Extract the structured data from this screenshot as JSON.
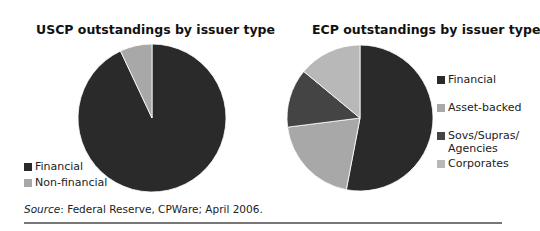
{
  "chart_data": [
    {
      "type": "pie",
      "title": "USCP outstandings by issuer type",
      "categories": [
        "Financial",
        "Non-financial"
      ],
      "values": [
        93,
        7
      ],
      "unit": "% (estimated from slice angles)",
      "colors": [
        "#2a2a2a",
        "#a8a8a8"
      ],
      "start_angle_deg": 0,
      "direction": "counterclockwise-for-second-slice",
      "legend_position": "bottom-left",
      "legend": [
        "Financial",
        "Non-financial"
      ]
    },
    {
      "type": "pie",
      "title": "ECP outstandings by issuer type",
      "categories": [
        "Financial",
        "Asset-backed",
        "Sovs/Supras/Agencies",
        "Corporates"
      ],
      "values": [
        53,
        20,
        13,
        14
      ],
      "unit": "% (estimated from slice angles)",
      "colors": [
        "#2a2a2a",
        "#a8a8a8",
        "#444444",
        "#b8b8b8"
      ],
      "start_angle_deg": 0,
      "direction": "clockwise",
      "legend_position": "right",
      "legend": [
        "Financial",
        "Asset-backed",
        "Sovs/Supras/\nAgencies",
        "Corporates"
      ]
    }
  ],
  "left": {
    "title": "USCP outstandings by issuer type",
    "legend": [
      {
        "label": "Financial",
        "color": "#2a2a2a"
      },
      {
        "label": "Non-financial",
        "color": "#a8a8a8"
      }
    ]
  },
  "right": {
    "title": "ECP outstandings by issuer type",
    "legend": [
      {
        "label": "Financial",
        "color": "#2a2a2a"
      },
      {
        "label": "Asset-backed",
        "color": "#a8a8a8"
      },
      {
        "label": "Sovs/Supras/",
        "label2": "Agencies",
        "color": "#444444"
      },
      {
        "label": "Corporates",
        "color": "#b8b8b8"
      }
    ]
  },
  "footer": {
    "source_label": "Source",
    "source_text": ": Federal Reserve, CPWare; April 2006."
  }
}
